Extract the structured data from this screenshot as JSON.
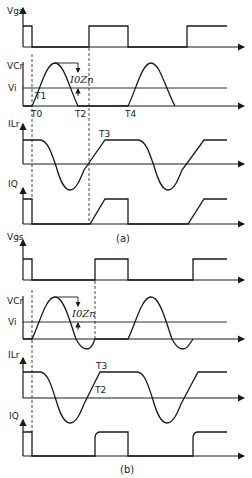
{
  "diagram": {
    "colors": {
      "ink": "#1a1a1a",
      "background": "#ffffff"
    },
    "panel_a": {
      "caption": "(a)",
      "traces": {
        "vgs": {
          "label": "Vgs"
        },
        "vc": {
          "label": "VCr",
          "level_label": "Vi",
          "amplitude_label": "I0Zn"
        },
        "ilr": {
          "label": "ILr"
        },
        "iq": {
          "label": "IQ"
        }
      },
      "time_markers": {
        "t0": "T0",
        "t1": "T1",
        "t2": "T2",
        "t3": "T3",
        "t4": "T4"
      }
    },
    "panel_b": {
      "caption": "(b)",
      "traces": {
        "vgs": {
          "label": "Vgs"
        },
        "vc": {
          "label": "VCr",
          "level_label": "Vi",
          "amplitude_label": "I0Zn"
        },
        "ilr": {
          "label": "ILr"
        },
        "iq": {
          "label": "IQ"
        }
      },
      "time_markers": {
        "t2": "T2",
        "t3": "T3"
      }
    }
  }
}
